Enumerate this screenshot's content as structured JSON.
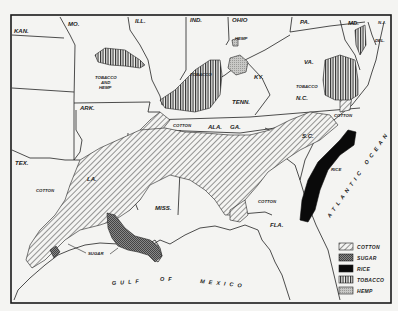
{
  "map": {
    "title": "Southern staple crop regions",
    "states": [
      "KAN.",
      "MO.",
      "ILL.",
      "IND.",
      "OHIO",
      "PA.",
      "MD.",
      "N.J.",
      "DEL.",
      "KY.",
      "VA.",
      "TENN.",
      "N.C.",
      "ARK.",
      "S.C.",
      "ALA.",
      "GA.",
      "TEX.",
      "LA.",
      "MISS.",
      "FLA."
    ],
    "water": {
      "gulf": "GULF OF MEXICO",
      "gulf_words": [
        "GULF",
        "OF",
        "MEXICO"
      ],
      "atlantic": "ATLANTIC OCEAN"
    },
    "callouts": {
      "tobacco_hemp": "TOBACCO AND HEMP",
      "tobacco_hemp_lines": [
        "TOBACCO",
        "AND",
        "HEMP"
      ],
      "tobacco_ky": "TOBACCO",
      "hemp_ky": "HEMP",
      "tobacco_va": "TOBACCO",
      "cotton_tn": "COTTON",
      "cotton_nc": "COTTON",
      "cotton_tx": "COTTON",
      "cotton_fl": "COTTON",
      "rice": "RICE",
      "sugar": "SUGAR"
    },
    "legend": [
      {
        "key": "cotton",
        "label": "COTTON",
        "pattern": "diagonal-hatch"
      },
      {
        "key": "sugar",
        "label": "SUGAR",
        "pattern": "crosshatch-dots"
      },
      {
        "key": "rice",
        "label": "RICE",
        "pattern": "solid-black"
      },
      {
        "key": "tobacco",
        "label": "TOBACCO",
        "pattern": "vertical-lines"
      },
      {
        "key": "hemp",
        "label": "HEMP",
        "pattern": "stipple"
      }
    ],
    "colors": {
      "ink": "#1a1a1a",
      "paper": "#f4f4f2",
      "rice": "#0a0a0a"
    }
  }
}
